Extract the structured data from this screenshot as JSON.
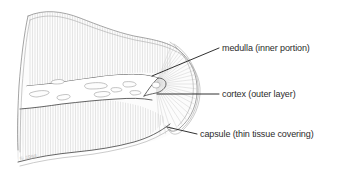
{
  "figure": {
    "background_color": "#ffffff",
    "line_color": "#4a4a4a",
    "label_color": "#2b2b2b",
    "hatch_color": "#c9c9c9"
  },
  "labels": [
    {
      "id": "medulla",
      "text": "medulla (inner portion)",
      "leader_from": [
        152,
        76
      ],
      "leader_to": [
        219,
        48
      ],
      "text_x": 222,
      "text_y": 51
    },
    {
      "id": "cortex",
      "text": "cortex (outer layer)",
      "leader_from": [
        157,
        94
      ],
      "leader_to": [
        219,
        94
      ],
      "text_x": 222,
      "text_y": 97
    },
    {
      "id": "capsule",
      "text": "capsule (thin tissue covering)",
      "leader_from": [
        167,
        127
      ],
      "leader_to": [
        197,
        134
      ],
      "text_x": 200,
      "text_y": 137
    }
  ],
  "watermark": {
    "text": "© 1998"
  },
  "regions": [
    {
      "id": "capsule-region",
      "name": "capsule",
      "description": "thin outer double-line covering following the wavy organ margin"
    },
    {
      "id": "cortex-region",
      "name": "cortex",
      "description": "outer layer shown with fine vertical hatching above and below the medulla"
    },
    {
      "id": "medulla-region",
      "name": "medulla",
      "description": "pale inner band containing small elongated vessel outlines"
    },
    {
      "id": "radial-fan",
      "name": "radial striations",
      "description": "fan of lines radiating from the medulla tip into the right lobe"
    }
  ]
}
